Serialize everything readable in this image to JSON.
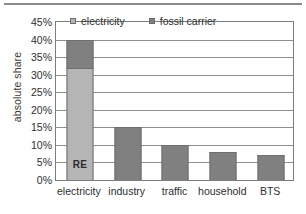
{
  "chart_data": {
    "type": "bar",
    "title": "",
    "xlabel": "",
    "ylabel": "absolute share",
    "ylim": [
      0,
      45
    ],
    "ytick_labels": [
      "0%",
      "5%",
      "10%",
      "15%",
      "20%",
      "25%",
      "30%",
      "35%",
      "40%",
      "45%"
    ],
    "ytick_values": [
      0,
      5,
      10,
      15,
      20,
      25,
      30,
      35,
      40,
      45
    ],
    "grid": true,
    "stacked": true,
    "legend_position": "top-center",
    "categories": [
      "electricity",
      "industry",
      "traffic",
      "household",
      "BTS"
    ],
    "series": [
      {
        "name": "electricity",
        "color": "#b5b5b5",
        "values": [
          32,
          0,
          0,
          0,
          0
        ]
      },
      {
        "name": "fossil carrier",
        "color": "#808080",
        "values": [
          8,
          15,
          10,
          8,
          7
        ]
      }
    ],
    "totals": [
      40,
      15,
      10,
      8,
      7
    ],
    "annotations": [
      {
        "text": "RE",
        "category": "electricity",
        "series": "electricity",
        "value": 5
      }
    ]
  },
  "legend": {
    "items": [
      {
        "label": "electricity",
        "color": "#b5b5b5",
        "marker": "square-marker"
      },
      {
        "label": "fossil carrier",
        "color": "#808080",
        "marker": "square-marker"
      }
    ]
  }
}
